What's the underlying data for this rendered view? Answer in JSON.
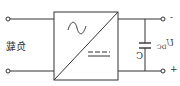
{
  "diagram": {
    "type": "circuit-schematic",
    "mirrored": true,
    "load_label": "负载",
    "capacitor_label": "C",
    "voltage_label": "U",
    "voltage_subscript": "DC",
    "terminal_top_sign": "-",
    "terminal_bottom_sign": "+",
    "converter_symbols": [
      "ac-sine",
      "dc"
    ],
    "colors": {
      "line": "#333333",
      "background": "#ffffff"
    }
  }
}
